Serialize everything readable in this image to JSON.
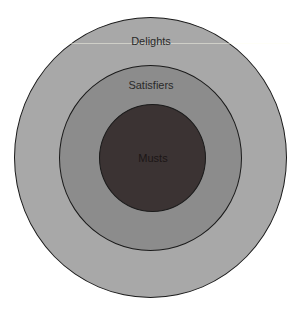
{
  "diagram": {
    "type": "concentric-circles",
    "rings": [
      {
        "id": "outer",
        "label": "Delights",
        "fill": "#a8a8a8"
      },
      {
        "id": "middle",
        "label": "Satisfiers",
        "fill": "#8c8c8c"
      },
      {
        "id": "inner",
        "label": "Musts",
        "fill": "#3b3333"
      }
    ],
    "stroke_color": "#1a1a1a",
    "background": "#ffffff"
  }
}
